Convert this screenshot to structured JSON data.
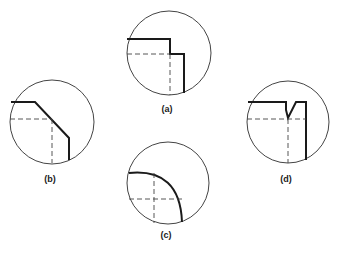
{
  "figure": {
    "panels": [
      {
        "id": "a",
        "label": "(a)",
        "description": "Square corner with step (shoulder)"
      },
      {
        "id": "b",
        "label": "(b)",
        "description": "Chamfered corner"
      },
      {
        "id": "c",
        "label": "(c)",
        "description": "Rounded (radiused) corner"
      },
      {
        "id": "d",
        "label": "(d)",
        "description": "Corner with V-notch relief"
      }
    ],
    "colors": {
      "outline": "#1a1a1a",
      "circle": "#444444",
      "background": "#ffffff"
    }
  }
}
